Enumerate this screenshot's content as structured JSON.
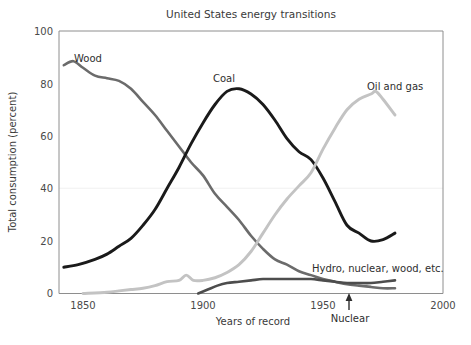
{
  "chart_data": {
    "type": "line",
    "title": "United States energy transitions",
    "xlabel": "Years of record",
    "ylabel": "Total consumption (percent)",
    "xlim": [
      1840,
      2000
    ],
    "ylim": [
      0,
      100
    ],
    "xticks": [
      1850,
      1900,
      1950,
      2000
    ],
    "yticks": [
      0,
      20,
      40,
      60,
      80,
      100
    ],
    "grid": "faint horizontal line at y=40",
    "legend_position": "inline labels on curves",
    "colors": {
      "wood": "#6b6b6b",
      "coal": "#1a1a1a",
      "oil_and_gas": "#c3c3c3",
      "hydro_nuclear_wood_etc": "#4d4d4d",
      "axis": "#8e8e8e",
      "gridline": "#f0f0f0",
      "text": "#3a3a3a"
    },
    "annotations": [
      {
        "text": "Nuclear",
        "x": 1962,
        "y": 0,
        "arrow": "up"
      }
    ],
    "series": [
      {
        "name": "Wood",
        "label": "Wood",
        "label_x": 1858,
        "label_y": 85,
        "color": "#6b6b6b",
        "x": [
          1842,
          1846,
          1850,
          1855,
          1860,
          1865,
          1870,
          1875,
          1880,
          1885,
          1890,
          1895,
          1900,
          1905,
          1910,
          1915,
          1920,
          1925,
          1930,
          1935,
          1940,
          1945,
          1950,
          1955,
          1960,
          1965,
          1970,
          1975,
          1980
        ],
        "values": [
          87,
          88.5,
          86,
          83,
          82,
          81,
          78,
          73,
          68,
          62,
          56,
          50,
          45,
          38,
          33,
          28,
          22,
          17,
          13,
          11,
          8.5,
          7,
          5.5,
          4.5,
          3.5,
          3,
          2.5,
          2,
          2
        ]
      },
      {
        "name": "Coal",
        "label": "Coal",
        "label_x": 1903,
        "label_y": 80,
        "color": "#1a1a1a",
        "x": [
          1842,
          1848,
          1855,
          1860,
          1865,
          1870,
          1875,
          1880,
          1885,
          1890,
          1895,
          1900,
          1905,
          1910,
          1915,
          1920,
          1925,
          1930,
          1935,
          1940,
          1945,
          1950,
          1955,
          1960,
          1965,
          1970,
          1975,
          1980
        ],
        "values": [
          10,
          11,
          13,
          15,
          18,
          21,
          26,
          32,
          40,
          48,
          57,
          65,
          72,
          77,
          78,
          76,
          72,
          66,
          59,
          54,
          51,
          44,
          35,
          26,
          23,
          20,
          20.5,
          23
        ]
      },
      {
        "name": "Oil and gas",
        "label": "Oil and gas",
        "label_x": 1947,
        "label_y": 81,
        "color": "#c3c3c3",
        "x": [
          1850,
          1860,
          1865,
          1870,
          1875,
          1880,
          1885,
          1890,
          1893,
          1896,
          1900,
          1905,
          1910,
          1915,
          1920,
          1925,
          1930,
          1935,
          1940,
          1945,
          1950,
          1955,
          1960,
          1965,
          1970,
          1972,
          1975,
          1980
        ],
        "values": [
          0,
          0.5,
          1,
          1.5,
          2,
          3,
          4.5,
          5,
          7,
          5,
          5,
          6,
          8,
          11,
          16,
          23,
          30,
          36,
          41,
          46,
          55,
          63,
          70,
          74,
          76,
          77,
          74,
          68
        ]
      },
      {
        "name": "Hydro, nuclear, wood, etc.",
        "label": "Hydro, nuclear, wood, etc.",
        "label_x": 1953,
        "label_y": 9,
        "color": "#4d4d4d",
        "x": [
          1898,
          1902,
          1906,
          1910,
          1915,
          1920,
          1925,
          1930,
          1935,
          1940,
          1945,
          1950,
          1955,
          1960,
          1965,
          1970,
          1975,
          1980
        ],
        "values": [
          0,
          1.5,
          3,
          4,
          4.5,
          5,
          5.5,
          5.5,
          5.5,
          5.5,
          5.5,
          5,
          4.5,
          4,
          4,
          4,
          4.5,
          5
        ]
      }
    ]
  },
  "figure": {
    "title": "United States energy transitions",
    "xlabel": "Years of record",
    "ylabel": "Total consumption (percent)",
    "nuclear_annotation": "Nuclear",
    "tick_1850": "1850",
    "tick_1900": "1900",
    "tick_1950": "1950",
    "tick_2000": "2000",
    "ytick_0": "0",
    "ytick_20": "20",
    "ytick_40": "40",
    "ytick_60": "60",
    "ytick_80": "80",
    "ytick_100": "100",
    "label_wood": "Wood",
    "label_coal": "Coal",
    "label_oil": "Oil and gas",
    "label_hydro": "Hydro, nuclear, wood, etc."
  }
}
